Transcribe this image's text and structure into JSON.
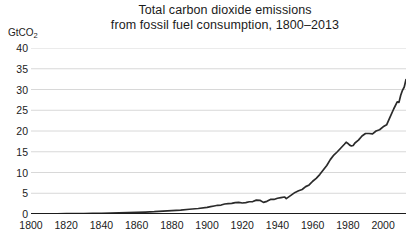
{
  "chart_data": {
    "type": "line",
    "title": "Total carbon dioxide emissions from fossil fuel consumption, 1800–2013",
    "title_lines": [
      "Total carbon dioxide emissions",
      "from fossil fuel consumption, 1800–2013"
    ],
    "xlabel": "",
    "ylabel": "GtCO2",
    "ylabel_display": "GtCO",
    "ylabel_subscript": "2",
    "xlim": [
      1800,
      2013
    ],
    "ylim": [
      0,
      40
    ],
    "grid": "horizontal",
    "legend": "none",
    "line_color": "#2b2b2b",
    "grid_color": "#d8d8d8",
    "axis_color": "#1b1b1b",
    "background_color": "#ffffff",
    "yticks": [
      0,
      5,
      10,
      15,
      20,
      25,
      30,
      35,
      40
    ],
    "ytick_labels": [
      "0",
      "5",
      "10",
      "15",
      "20",
      "25",
      "30",
      "35",
      "40"
    ],
    "xticks": [
      1800,
      1820,
      1840,
      1860,
      1880,
      1900,
      1920,
      1940,
      1960,
      1980,
      2000
    ],
    "xtick_labels": [
      "1800",
      "1820",
      "1840",
      "1860",
      "1880",
      "1900",
      "1920",
      "1940",
      "1960",
      "1980",
      "2000"
    ],
    "series": [
      {
        "name": "Total CO2 emissions from fossil fuel consumption",
        "unit": "GtCO2",
        "x": [
          1800,
          1805,
          1810,
          1815,
          1820,
          1825,
          1830,
          1835,
          1840,
          1845,
          1850,
          1855,
          1860,
          1865,
          1870,
          1875,
          1880,
          1885,
          1890,
          1895,
          1900,
          1902,
          1904,
          1906,
          1908,
          1910,
          1912,
          1914,
          1916,
          1918,
          1920,
          1922,
          1924,
          1926,
          1928,
          1930,
          1932,
          1934,
          1936,
          1938,
          1940,
          1942,
          1944,
          1945,
          1946,
          1948,
          1950,
          1952,
          1954,
          1956,
          1958,
          1960,
          1962,
          1964,
          1966,
          1968,
          1970,
          1972,
          1974,
          1976,
          1978,
          1979,
          1980,
          1981,
          1982,
          1983,
          1984,
          1986,
          1988,
          1990,
          1992,
          1994,
          1996,
          1998,
          2000,
          2002,
          2004,
          2006,
          2008,
          2009,
          2010,
          2011,
          2012,
          2013
        ],
        "values": [
          0.03,
          0.04,
          0.05,
          0.06,
          0.07,
          0.09,
          0.11,
          0.14,
          0.17,
          0.21,
          0.25,
          0.33,
          0.4,
          0.47,
          0.55,
          0.68,
          0.82,
          0.95,
          1.15,
          1.32,
          1.6,
          1.76,
          1.92,
          2.1,
          2.16,
          2.41,
          2.5,
          2.55,
          2.75,
          2.8,
          2.65,
          2.75,
          2.95,
          3.0,
          3.35,
          3.3,
          2.8,
          3.05,
          3.5,
          3.5,
          3.8,
          3.95,
          4.1,
          3.7,
          4.0,
          4.6,
          5.2,
          5.6,
          5.9,
          6.6,
          7.0,
          7.9,
          8.6,
          9.5,
          10.6,
          11.7,
          13.1,
          14.2,
          15.0,
          15.9,
          16.8,
          17.3,
          17.0,
          16.6,
          16.4,
          16.5,
          17.1,
          17.8,
          18.8,
          19.4,
          19.4,
          19.3,
          20.0,
          20.3,
          21.0,
          21.5,
          23.4,
          25.3,
          27.0,
          26.9,
          28.6,
          29.8,
          30.6,
          32.4
        ]
      }
    ],
    "notes": {
      "start_value": 0.03,
      "end_value": 32.4,
      "peak_value": 32.4,
      "peak_year": 2013
    }
  },
  "figure": {
    "width": 410,
    "height": 250
  }
}
